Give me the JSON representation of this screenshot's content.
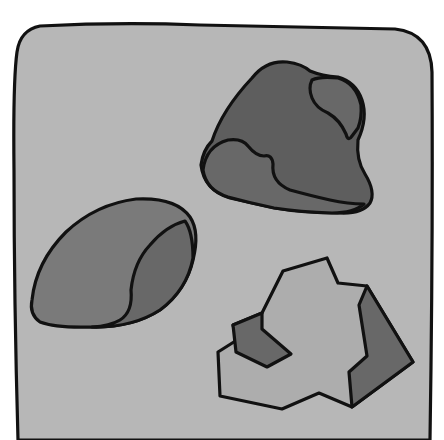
{
  "title": "Three rocks illustration",
  "colors": {
    "background": "#ffffff",
    "panel": "#b7b7b7",
    "outline": "#111111",
    "rock_dark": "#5e5e5e",
    "rock_mid": "#7a7a7a",
    "rock_shadow": "#686868",
    "rock_light": "#adadad"
  },
  "objects": [
    {
      "id": "panel",
      "label": "Rounded gray panel"
    },
    {
      "id": "rock_top_right",
      "label": "Dark lumpy rock with mottled patches"
    },
    {
      "id": "rock_left",
      "label": "Smooth oval pebble"
    },
    {
      "id": "rock_bottom_right",
      "label": "Angular faceted light rock"
    }
  ]
}
